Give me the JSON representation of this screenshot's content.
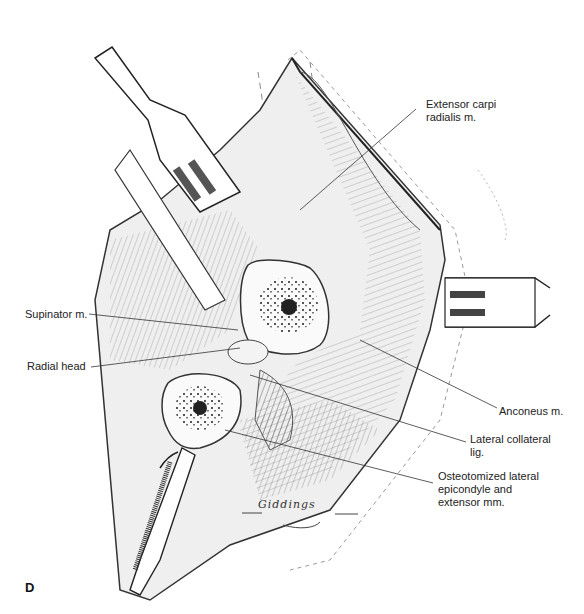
{
  "figure": {
    "panel_letter": "D",
    "signature": "Giddings",
    "labels": [
      {
        "id": "extensor-carpi-radialis",
        "text": "Extensor carpi\nradialis m."
      },
      {
        "id": "supinator",
        "text": "Supinator m."
      },
      {
        "id": "radial-head",
        "text": "Radial head"
      },
      {
        "id": "anconeus",
        "text": "Anconeus m."
      },
      {
        "id": "lateral-collateral",
        "text": "Lateral collateral\nlig."
      },
      {
        "id": "osteotomized",
        "text": "Osteotomized lateral\nepicondyle and\nextensor mm."
      }
    ],
    "colors": {
      "ink": "#222222",
      "shade": "#888888",
      "light_shade": "#d8d8d8",
      "bone": "#fafafa",
      "marrow": "#333333"
    }
  }
}
